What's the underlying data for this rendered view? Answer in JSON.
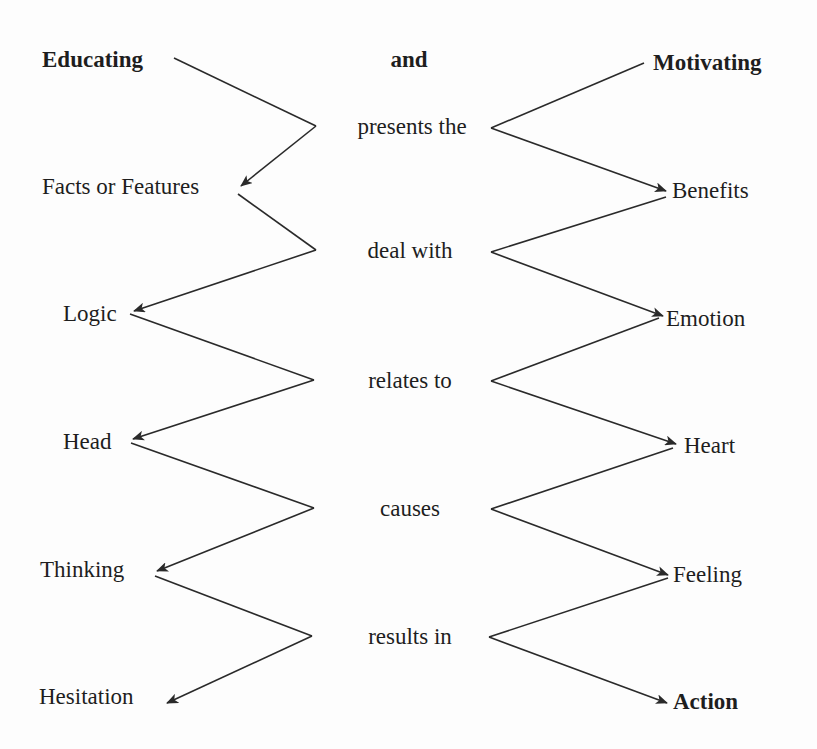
{
  "diagram": {
    "header": {
      "left": "Educating",
      "center": "and",
      "right": "Motivating"
    },
    "left_column": [
      "Facts or Features",
      "Logic",
      "Head",
      "Thinking",
      "Hesitation"
    ],
    "center_column": [
      "presents the",
      "deal with",
      "relates to",
      "causes",
      "results in"
    ],
    "right_column": [
      "Benefits",
      "Emotion",
      "Heart",
      "Feeling",
      "Action"
    ],
    "line_color": "#2a2a2a",
    "text_color": "#1e1e1e"
  }
}
